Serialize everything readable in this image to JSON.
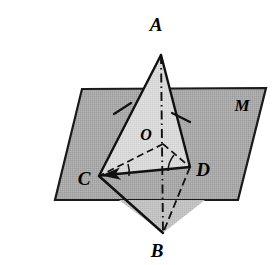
{
  "figure": {
    "caption": "",
    "type": "solid-geometry-diagram"
  },
  "labels": {
    "apex_top": "A",
    "apex_bottom": "B",
    "vertex_left": "C",
    "vertex_right": "D",
    "center": "O",
    "plane": "M"
  },
  "colors": {
    "plane_fill": "#a9a9a9",
    "plane_stroke": "#1a1a1a",
    "triangle_fill": "#d6d6d6",
    "triangle_fill_lower": "#bdbdbd",
    "line": "#111111",
    "background": "#ffffff"
  },
  "points": {
    "A": {
      "x": 161,
      "y": 55,
      "label_x": 156,
      "label_y": 31
    },
    "B": {
      "x": 163,
      "y": 233,
      "label_x": 157,
      "label_y": 255
    },
    "C": {
      "x": 99,
      "y": 176,
      "label_x": 84,
      "label_y": 184
    },
    "D": {
      "x": 190,
      "y": 167,
      "label_x": 198,
      "label_y": 176
    },
    "O": {
      "x": 163,
      "y": 144,
      "label_x": 142,
      "label_y": 140
    },
    "M": {
      "label_x": 237,
      "label_y": 110
    }
  },
  "plane": {
    "corners": [
      {
        "x": 82,
        "y": 89
      },
      {
        "x": 266,
        "y": 88
      },
      {
        "x": 238,
        "y": 200
      },
      {
        "x": 55,
        "y": 200
      }
    ]
  },
  "tick_marks": [
    {
      "name": "tick-on-AC",
      "x": 122,
      "y": 109,
      "angle": -28
    },
    {
      "name": "tick-on-AD",
      "x": 181,
      "y": 118,
      "angle": 22
    }
  ],
  "angle_arcs": [
    {
      "name": "angle-at-C",
      "vertex": "C",
      "radius": 26
    },
    {
      "name": "angle-at-D",
      "vertex": "D",
      "radius": 24
    }
  ],
  "segments": [
    {
      "name": "segment-AC",
      "from": "A",
      "to": "C",
      "style": "solid"
    },
    {
      "name": "segment-AD",
      "from": "A",
      "to": "D",
      "style": "solid"
    },
    {
      "name": "segment-CD",
      "from": "C",
      "to": "D",
      "style": "solid"
    },
    {
      "name": "segment-CB",
      "from": "C",
      "to": "B",
      "style": "solid"
    },
    {
      "name": "segment-DB",
      "from": "D",
      "to": "B",
      "style": "dashed"
    },
    {
      "name": "segment-AB",
      "from": "A",
      "to": "B",
      "style": "dash-dot"
    },
    {
      "name": "segment-OC",
      "from": "O",
      "to": "C",
      "style": "dashed"
    },
    {
      "name": "segment-OD",
      "from": "O",
      "to": "D",
      "style": "dashed"
    }
  ]
}
